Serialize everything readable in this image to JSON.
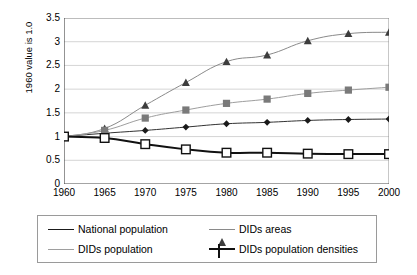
{
  "chart_data": {
    "type": "line",
    "title": "",
    "xlabel": "",
    "ylabel": "1960 value is 1.0",
    "x": [
      1960,
      1965,
      1970,
      1975,
      1980,
      1985,
      1990,
      1995,
      2000
    ],
    "xticklabels": [
      "1960",
      "1965",
      "1970",
      "1975",
      "1980",
      "1985",
      "1990",
      "1995",
      "2000"
    ],
    "yticklabels": [
      "0",
      "0.5",
      "1",
      "1.5",
      "2",
      "2.5",
      "3",
      "3.5"
    ],
    "yticks": [
      0,
      0.5,
      1,
      1.5,
      2,
      2.5,
      3,
      3.5
    ],
    "ylim": [
      0,
      3.5
    ],
    "xlim": [
      1960,
      2000
    ],
    "grid": "horizontal",
    "legend_position": "bottom",
    "series": [
      {
        "name": "National population",
        "marker": "diamond-filled",
        "color": "#1a1a1a",
        "values": [
          1.0,
          1.07,
          1.13,
          1.2,
          1.27,
          1.3,
          1.34,
          1.36,
          1.37
        ]
      },
      {
        "name": "DIDs areas",
        "marker": "triangle-filled",
        "color": "#3d3d3d",
        "values": [
          1.0,
          1.17,
          1.66,
          2.14,
          2.58,
          2.72,
          3.02,
          3.17,
          3.2
        ]
      },
      {
        "name": "DIDs population",
        "marker": "square-filled",
        "color": "#7a7a7a",
        "values": [
          1.0,
          1.13,
          1.39,
          1.56,
          1.7,
          1.79,
          1.91,
          1.98,
          2.04
        ]
      },
      {
        "name": "DIDs population densities",
        "marker": "square-open",
        "color": "#111111",
        "values": [
          1.0,
          0.97,
          0.84,
          0.73,
          0.66,
          0.66,
          0.64,
          0.63,
          0.63
        ]
      }
    ]
  },
  "legend": {
    "items": [
      {
        "label": "National population"
      },
      {
        "label": "DIDs areas"
      },
      {
        "label": "DIDs population"
      },
      {
        "label": "DIDs population densities"
      }
    ]
  }
}
